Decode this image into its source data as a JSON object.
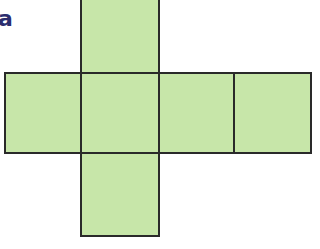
{
  "figure": {
    "label": "a",
    "fill_color": "#c7e6a9",
    "stroke_color": "#2a2a2a",
    "label_color": "#2b2d6e",
    "squares": [
      {
        "name": "top",
        "row": 0,
        "col": 1
      },
      {
        "name": "left",
        "row": 1,
        "col": 0
      },
      {
        "name": "center",
        "row": 1,
        "col": 1
      },
      {
        "name": "right-inner",
        "row": 1,
        "col": 2
      },
      {
        "name": "right-outer",
        "row": 1,
        "col": 3
      },
      {
        "name": "bottom",
        "row": 2,
        "col": 1
      }
    ]
  }
}
